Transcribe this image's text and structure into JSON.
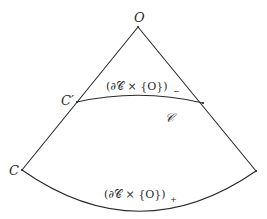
{
  "diagram": {
    "colors": {
      "stroke": "#2a2a2a",
      "background": "#ffffff"
    },
    "points": {
      "apex": {
        "label": "O",
        "x": 138,
        "y": 27
      },
      "inner_left": {
        "label": "C′",
        "x": 77,
        "y": 102
      },
      "inner_right": {
        "label": "",
        "x": 203,
        "y": 103
      },
      "outer_left": {
        "label": "C",
        "x": 22,
        "y": 170
      },
      "outer_right": {
        "label": "",
        "x": 256,
        "y": 171
      }
    },
    "labels": {
      "apex": "O",
      "inner_left_point": "C′",
      "outer_left_point": "C",
      "inner_arc": "(∂𝒞 × {O})",
      "inner_arc_subscript": "−",
      "outer_arc": "(∂𝒞 × {O})",
      "outer_arc_subscript": "+",
      "region": "𝒞"
    }
  }
}
